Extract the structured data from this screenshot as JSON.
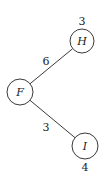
{
  "diagram": {
    "type": "tree",
    "nodes": [
      {
        "id": "H",
        "label": "H",
        "value": "3",
        "cx": 82,
        "cy": 41,
        "r": 12,
        "value_pos": "above"
      },
      {
        "id": "F",
        "label": "F",
        "value": "",
        "cx": 20,
        "cy": 92,
        "r": 13,
        "value_pos": "none"
      },
      {
        "id": "I",
        "label": "I",
        "value": "4",
        "cx": 85,
        "cy": 146,
        "r": 13,
        "value_pos": "below"
      }
    ],
    "edges": [
      {
        "from": "F",
        "to": "H",
        "weight": "6"
      },
      {
        "from": "F",
        "to": "I",
        "weight": "3"
      }
    ]
  }
}
